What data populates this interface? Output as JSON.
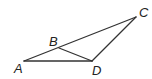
{
  "figure": {
    "type": "geometry",
    "points": {
      "A": {
        "x": 24,
        "y": 61,
        "label": "A",
        "lx": 14,
        "ly": 73
      },
      "B": {
        "x": 59,
        "y": 48,
        "label": "B",
        "lx": 49,
        "ly": 46
      },
      "C": {
        "x": 136,
        "y": 17,
        "label": "C",
        "lx": 139,
        "ly": 17
      },
      "D": {
        "x": 92,
        "y": 61,
        "label": "D",
        "lx": 92,
        "ly": 75
      }
    },
    "segments": [
      [
        "A",
        "C"
      ],
      [
        "A",
        "D"
      ],
      [
        "D",
        "C"
      ],
      [
        "B",
        "D"
      ]
    ],
    "line_color": "#333333"
  }
}
